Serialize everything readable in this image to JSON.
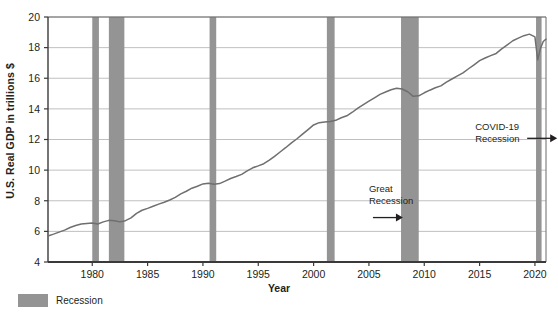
{
  "figure": {
    "background": "#ffffff",
    "ink_color": "#231f20",
    "line_color": "#6f6f6f",
    "band_color": "#949494",
    "grid_color": "#b9b9b9",
    "axis_color": "#6a6a6a"
  },
  "axis_labels": {
    "y": "U.S. Real GDP in trillions $",
    "x": "Year"
  },
  "legend": {
    "position": "below-axis-left",
    "entries": [
      {
        "label": "Recession",
        "swatch_color": "#949494",
        "name": "recession-band"
      }
    ]
  },
  "annotations": [
    {
      "id": "great-recession",
      "lines": [
        "Great",
        "Recession"
      ],
      "arrow": "right",
      "x_year": 2005.0,
      "y_value": 8.6
    },
    {
      "id": "covid-19-recession",
      "lines": [
        "COVID-19",
        "Recession"
      ],
      "arrow": "right",
      "x_year": 2014.6,
      "y_value": 12.6
    }
  ],
  "chart_data": {
    "type": "line",
    "title": "",
    "subtitle": "",
    "xlabel": "Year",
    "ylabel": "U.S. Real GDP in trillions $",
    "xlim": [
      1976.0,
      2021.0
    ],
    "ylim": [
      4,
      20
    ],
    "xticks": [
      1980,
      1985,
      1990,
      1995,
      2000,
      2005,
      2010,
      2015,
      2020
    ],
    "xtick_labels": [
      "1980",
      "1985",
      "1990",
      "1995",
      "2000",
      "2005",
      "2010",
      "2015",
      "2020"
    ],
    "yticks": [
      4,
      6,
      8,
      10,
      12,
      14,
      16,
      18,
      20
    ],
    "ytick_labels": [
      "4",
      "6",
      "8",
      "10",
      "12",
      "14",
      "16",
      "18",
      "20"
    ],
    "grid": "horizontal-only",
    "legend_position": "below-plot-left",
    "series": [
      {
        "name": "U.S. Real GDP",
        "units": "trillions of chained dollars",
        "color": "#6f6f6f",
        "x": [
          1976.0,
          1976.5,
          1977.0,
          1977.5,
          1978.0,
          1978.5,
          1979.0,
          1979.5,
          1980.0,
          1980.5,
          1981.0,
          1981.5,
          1982.0,
          1982.5,
          1983.0,
          1983.5,
          1984.0,
          1984.5,
          1985.0,
          1985.5,
          1986.0,
          1986.5,
          1987.0,
          1987.5,
          1988.0,
          1988.5,
          1989.0,
          1989.5,
          1990.0,
          1990.5,
          1991.0,
          1991.5,
          1992.0,
          1992.5,
          1993.0,
          1993.5,
          1994.0,
          1994.5,
          1995.0,
          1995.5,
          1996.0,
          1996.5,
          1997.0,
          1997.5,
          1998.0,
          1998.5,
          1999.0,
          1999.5,
          2000.0,
          2000.5,
          2001.0,
          2001.5,
          2002.0,
          2002.5,
          2003.0,
          2003.5,
          2004.0,
          2004.5,
          2005.0,
          2005.5,
          2006.0,
          2006.5,
          2007.0,
          2007.5,
          2008.0,
          2008.5,
          2009.0,
          2009.5,
          2010.0,
          2010.5,
          2011.0,
          2011.5,
          2012.0,
          2012.5,
          2013.0,
          2013.5,
          2014.0,
          2014.5,
          2015.0,
          2015.5,
          2016.0,
          2016.5,
          2017.0,
          2017.5,
          2018.0,
          2018.5,
          2019.0,
          2019.5,
          2020.0,
          2020.25,
          2020.5,
          2020.75,
          2021.0
        ],
        "y": [
          5.7,
          5.82,
          5.95,
          6.08,
          6.25,
          6.38,
          6.48,
          6.52,
          6.55,
          6.48,
          6.62,
          6.72,
          6.7,
          6.62,
          6.7,
          6.88,
          7.18,
          7.38,
          7.5,
          7.64,
          7.78,
          7.9,
          8.05,
          8.22,
          8.45,
          8.62,
          8.82,
          8.95,
          9.1,
          9.15,
          9.08,
          9.12,
          9.28,
          9.45,
          9.58,
          9.72,
          9.95,
          10.15,
          10.28,
          10.42,
          10.65,
          10.92,
          11.2,
          11.48,
          11.78,
          12.05,
          12.35,
          12.65,
          12.95,
          13.1,
          13.15,
          13.18,
          13.25,
          13.42,
          13.55,
          13.78,
          14.05,
          14.28,
          14.5,
          14.72,
          14.95,
          15.1,
          15.25,
          15.35,
          15.3,
          15.12,
          14.82,
          14.85,
          15.05,
          15.22,
          15.38,
          15.5,
          15.75,
          15.95,
          16.15,
          16.35,
          16.62,
          16.88,
          17.15,
          17.32,
          17.48,
          17.62,
          17.92,
          18.18,
          18.45,
          18.62,
          18.78,
          18.88,
          18.7,
          17.2,
          17.95,
          18.4,
          18.55
        ]
      }
    ],
    "shaded_regions": [
      {
        "label": "Recession",
        "start": 1980.0,
        "end": 1980.6,
        "color": "#949494"
      },
      {
        "label": "Recession",
        "start": 1981.5,
        "end": 1982.9,
        "color": "#949494"
      },
      {
        "label": "Recession",
        "start": 1990.6,
        "end": 1991.2,
        "color": "#949494"
      },
      {
        "label": "Recession",
        "start": 2001.2,
        "end": 2001.9,
        "color": "#949494"
      },
      {
        "label": "Recession",
        "start": 2007.9,
        "end": 2009.5,
        "color": "#949494"
      },
      {
        "label": "Recession",
        "start": 2020.1,
        "end": 2020.6,
        "color": "#949494"
      }
    ]
  }
}
